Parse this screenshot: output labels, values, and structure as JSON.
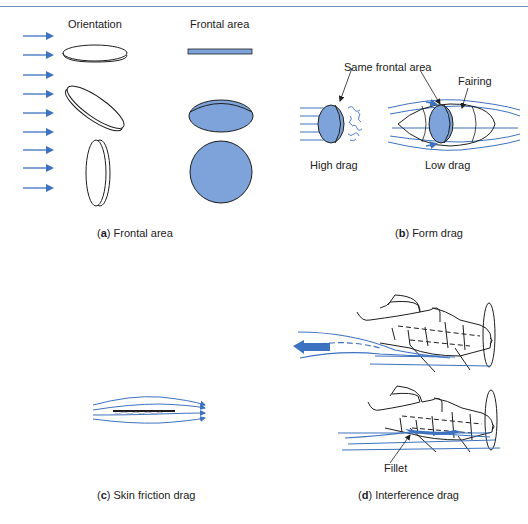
{
  "colors": {
    "accent_blue": "#3d72c0",
    "fill_blue": "#7ea3da",
    "line_dark": "#1e1e1e",
    "top_rule": "#6f8fc0"
  },
  "panel_a": {
    "header_orientation": "Orientation",
    "header_frontal_area": "Frontal area",
    "caption_letter": "a",
    "caption_text": "Frontal area",
    "flow_arrows": 9
  },
  "panel_b": {
    "callout_same_frontal_area": "Same frontal area",
    "callout_fairing": "Fairing",
    "label_high_drag": "High drag",
    "label_low_drag": "Low drag",
    "caption_letter": "b",
    "caption_text": "Form drag"
  },
  "panel_c": {
    "caption_letter": "c",
    "caption_text": "Skin friction drag"
  },
  "panel_d": {
    "callout_fillet": "Fillet",
    "caption_letter": "d",
    "caption_text": "Interference drag"
  }
}
